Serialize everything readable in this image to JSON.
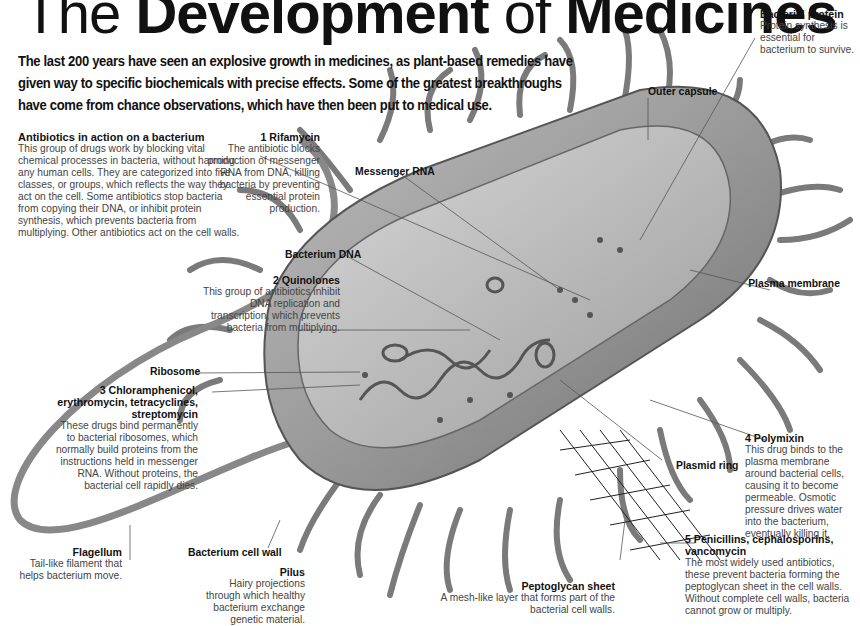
{
  "title": {
    "light1": "The ",
    "bold1": "Development",
    "light2": " of ",
    "bold2": "Medicines"
  },
  "intro": "The last 200 years have seen an explosive growth in medicines, as plant-based remedies have given way to specific biochemicals with precise effects. Some of the greatest breakthroughs have come from chance observations, which have then been put to medical use.",
  "panels": {
    "antibiotics": {
      "heading": "Antibiotics in action on a bacterium",
      "body": "This group of drugs work by blocking vital chemical processes in bacteria, without harming any human cells. They are categorized into five classes, or groups, which reflects the way they act on the cell. Some antibiotics stop bacteria from copying their DNA, or inhibit protein synthesis, which prevents bacteria from multiplying. Other antibiotics act on the cell walls."
    },
    "rifamycin": {
      "num": "1",
      "heading": "Rifamycin",
      "body": "The antibiotic blocks production of messenger RNA from DNA, killing bacteria by preventing essential protein production."
    },
    "quinolones": {
      "num": "2",
      "heading": "Quinolones",
      "body": "This group of antibiotics inhibit DNA replication and transcription, which prevents bacteria from multiplying."
    },
    "chloramphenicol": {
      "num": "3",
      "heading": "Chloramphenicol, erythromycin, tetracyclines, streptomycin",
      "body": "These drugs bind permanently to bacterial ribosomes, which normally build proteins from the instructions held in messenger RNA. Without proteins, the bacterial cell rapidly dies."
    },
    "polymixin": {
      "num": "4",
      "heading": "Polymixin",
      "body": "This drug binds to the plasma membrane around bacterial cells, causing it to become permeable. Osmotic pressure drives water into the bacterium, eventually killing it."
    },
    "penicillins": {
      "num": "5",
      "heading": "Penicillins, cephalosporins, vancomycin",
      "body": "The most widely used antibiotics, these prevent bacteria forming the peptoglycan sheet in the cell walls. Without complete cell walls, bacteria cannot grow or multiply."
    },
    "bacterial_protein": {
      "heading": "Bacterial protein",
      "body": "Protein synthesis is essential for bacterium to survive."
    },
    "flagellum": {
      "heading": "Flagellum",
      "body": "Tail-like filament that helps bacterium move."
    },
    "pilus": {
      "heading": "Pilus",
      "body": "Hairy projections through which healthy bacterium exchange genetic material."
    },
    "peptoglycan": {
      "heading": "Peptoglycan sheet",
      "body": "A mesh-like layer that forms part of the bacterial cell walls."
    }
  },
  "labels": {
    "outer_capsule": "Outer capsule",
    "messenger_rna": "Messenger RNA",
    "bacterium_dna": "Bacterium DNA",
    "plasma_membrane": "Plasma membrane",
    "ribosome": "Ribosome",
    "plasmid_ring": "Plasmid ring",
    "cell_wall": "Bacterium cell wall"
  }
}
